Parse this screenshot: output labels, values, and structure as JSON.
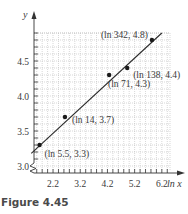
{
  "chart_data": {
    "type": "scatter",
    "title": "",
    "xlabel": "ln x",
    "ylabel": "y",
    "xlim": [
      1.5,
      6.5
    ],
    "ylim": [
      3.0,
      4.9
    ],
    "x_ticks": [
      2.2,
      3.2,
      4.2,
      5.2,
      6.2
    ],
    "x_tick_labels": [
      "2.2",
      "3.2",
      "4.2",
      "5.2",
      "6.2"
    ],
    "y_ticks": [
      3.0,
      3.5,
      4.0,
      4.5
    ],
    "y_tick_labels": [
      "3.0",
      "3.5",
      "4.0",
      "4.5"
    ],
    "grid": true,
    "grid_minor_x_step": 0.2,
    "grid_minor_y_step": 0.1,
    "axis_break": "y-axis near origin",
    "series": [
      {
        "name": "data points",
        "points": [
          {
            "x": 1.705,
            "y": 3.3,
            "label": "(ln 5.5, 3.3)"
          },
          {
            "x": 2.639,
            "y": 3.7,
            "label": "(ln 14, 3.7)"
          },
          {
            "x": 4.263,
            "y": 4.3,
            "label": "(ln 71, 4.3)"
          },
          {
            "x": 4.927,
            "y": 4.4,
            "label": "(ln 138, 4.4)"
          },
          {
            "x": 5.835,
            "y": 4.8,
            "label": "(ln 342, 4.8)"
          }
        ]
      },
      {
        "name": "fitted line",
        "type": "line",
        "x": [
          1.4,
          6.2
        ],
        "y": [
          3.18,
          4.9
        ]
      }
    ]
  },
  "caption": "Figure 4.45"
}
